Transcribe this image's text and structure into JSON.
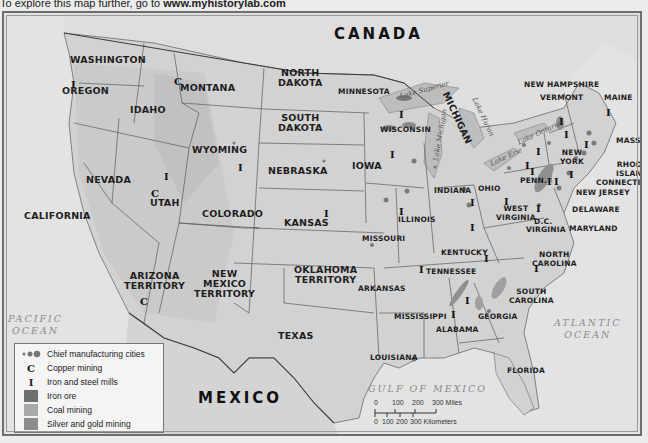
{
  "caption": {
    "prefix": "To explore this map further, go to ",
    "link": "www.myhistorylab.com"
  },
  "map": {
    "countries": [
      {
        "id": "canada",
        "label": "CANADA"
      },
      {
        "id": "mexico",
        "label": "MEXICO"
      }
    ],
    "oceans": [
      {
        "id": "pacific",
        "line1": "PACIFIC",
        "line2": "OCEAN"
      },
      {
        "id": "atlantic",
        "line1": "ATLANTIC",
        "line2": "OCEAN"
      },
      {
        "id": "gulf",
        "line1": "GULF OF MEXICO"
      }
    ],
    "lakes": [
      "Lake Superior",
      "Lake Michigan",
      "Lake Huron",
      "Lake Erie",
      "Lake Ontario"
    ],
    "states": {
      "washington": "WASHINGTON",
      "oregon": "OREGON",
      "california": "CALIFORNIA",
      "idaho": "IDAHO",
      "nevada": "NEVADA",
      "montana": "MONTANA",
      "wyoming": "WYOMING",
      "utah": "UTAH",
      "colorado": "COLORADO",
      "arizona_1": "ARIZONA",
      "arizona_2": "TERRITORY",
      "newmexico_1": "NEW",
      "newmexico_2": "MEXICO",
      "newmexico_3": "TERRITORY",
      "northdakota_1": "NORTH",
      "northdakota_2": "DAKOTA",
      "southdakota_1": "SOUTH",
      "southdakota_2": "DAKOTA",
      "nebraska": "NEBRASKA",
      "kansas": "KANSAS",
      "oklahoma_1": "OKLAHOMA",
      "oklahoma_2": "TERRITORY",
      "texas": "TEXAS",
      "minnesota": "MINNESOTA",
      "iowa": "IOWA",
      "missouri": "MISSOURI",
      "arkansas": "ARKANSAS",
      "louisiana": "LOUISIANA",
      "wisconsin": "WISCONSIN",
      "michigan": "MICHIGAN",
      "illinois": "ILLINOIS",
      "indiana": "INDIANA",
      "ohio": "OHIO",
      "kentucky": "KENTUCKY",
      "tennessee": "TENNESSEE",
      "mississippi": "MISSISSIPPI",
      "alabama": "ALABAMA",
      "georgia": "GEORGIA",
      "florida": "FLORIDA",
      "southcarolina_1": "SOUTH",
      "southcarolina_2": "CAROLINA",
      "northcarolina_1": "NORTH",
      "northcarolina_2": "CAROLINA",
      "virginia": "VIRGINIA",
      "westvirginia_1": "WEST",
      "westvirginia_2": "VIRGINIA",
      "dc": "D.C.",
      "maryland": "MARYLAND",
      "delaware": "DELAWARE",
      "newjersey": "NEW JERSEY",
      "penn": "PENN.",
      "newyork_1": "NEW",
      "newyork_2": "YORK",
      "connecticut": "CONNECTICUT",
      "rhodeisland_1": "RHODE",
      "rhodeisland_2": "ISLAND",
      "mass": "MASS.",
      "vermont": "VERMONT",
      "newhampshire": "NEW HAMPSHIRE",
      "maine": "MAINE"
    },
    "symbols": {
      "copper": "C",
      "iron_steel": "I"
    }
  },
  "legend": {
    "items": [
      {
        "key": "cities",
        "label": "Chief manufacturing cities"
      },
      {
        "key": "C",
        "label": "Copper mining"
      },
      {
        "key": "I",
        "label": "Iron and steel mills"
      },
      {
        "key": "iron-ore",
        "label": "Iron ore",
        "color": "#6f6f6f"
      },
      {
        "key": "coal",
        "label": "Coal mining",
        "color": "#a9a9a9"
      },
      {
        "key": "silver-gold",
        "label": "Silver and gold mining",
        "color": "#8c8c8c"
      }
    ]
  },
  "scale": {
    "miles_ticks": [
      "0",
      "100",
      "200",
      "300 Miles"
    ],
    "km_ticks": [
      "0",
      "100",
      "200",
      "300 Kilometers"
    ]
  },
  "colors": {
    "land": "#d6d6d6",
    "water": "#e2e2e2",
    "border": "#555555",
    "city": "#7a7a7a"
  }
}
